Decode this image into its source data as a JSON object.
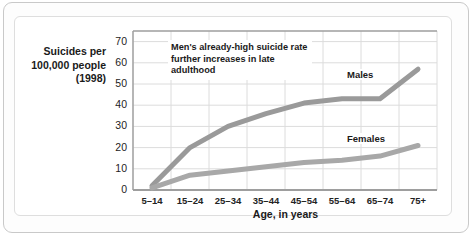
{
  "figure": {
    "y_axis_title": "Suicides per 100,000 people (1998)",
    "x_axis_title": "Age, in years",
    "annotation": "Men's already-high suicide rate further increases in late adulthood"
  },
  "chart_data": {
    "type": "line",
    "title": "",
    "xlabel": "Age, in years",
    "ylabel": "Suicides per 100,000 people (1998)",
    "categories": [
      "5–14",
      "15–24",
      "25–34",
      "35–44",
      "45–54",
      "55–64",
      "65–74",
      "75+"
    ],
    "yticks": [
      0,
      10,
      20,
      30,
      40,
      50,
      60,
      70
    ],
    "ylim": [
      0,
      75
    ],
    "grid": true,
    "legend": "inline-labels",
    "annotations": [
      {
        "text": "Men's already-high suicide rate further increases in late adulthood",
        "anchor": "upper-left"
      }
    ],
    "series": [
      {
        "name": "Males",
        "color": "#9a9a9a",
        "values": [
          2,
          20,
          30,
          36,
          41,
          43,
          43,
          57
        ]
      },
      {
        "name": "Females",
        "color": "#a8a8a8",
        "values": [
          1,
          7,
          9,
          11,
          13,
          14,
          16,
          21
        ]
      }
    ]
  },
  "colors": {
    "line_males": "#9a9a9a",
    "line_females": "#a8a8a8",
    "grid": "#dcdcdc",
    "axis": "#9e9e9e",
    "text": "#1a1a1a",
    "frame": "#c9c9c9",
    "panel_bg": "#ffffff"
  }
}
